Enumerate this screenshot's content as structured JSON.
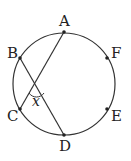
{
  "diagram": {
    "type": "circle-with-chords",
    "circle": {
      "cx": 64,
      "cy": 84,
      "r": 51
    },
    "points": [
      {
        "name": "A",
        "x": 64,
        "y": 32
      },
      {
        "name": "B",
        "x": 20,
        "y": 58
      },
      {
        "name": "C",
        "x": 20,
        "y": 109
      },
      {
        "name": "D",
        "x": 64,
        "y": 135
      },
      {
        "name": "E",
        "x": 107,
        "y": 109
      },
      {
        "name": "F",
        "x": 107,
        "y": 58
      }
    ],
    "chords": [
      [
        "A",
        "C"
      ],
      [
        "B",
        "D"
      ]
    ],
    "angle_label": "x",
    "labels": {
      "A": "A",
      "B": "B",
      "C": "C",
      "D": "D",
      "E": "E",
      "F": "F",
      "x": "x"
    }
  }
}
